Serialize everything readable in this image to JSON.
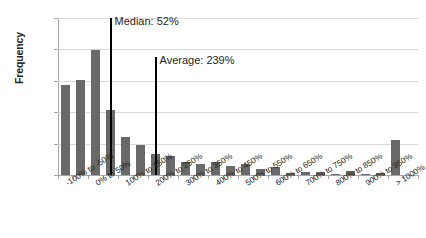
{
  "chart_data": {
    "type": "bar",
    "title": "",
    "subtitle": "",
    "xlabel": "",
    "ylabel": "Frequency",
    "ylim": [
      0,
      25
    ],
    "ytick_labels": [
      "0%",
      "5%",
      "10%",
      "15%",
      "20%",
      "25%"
    ],
    "ytick_values": [
      0,
      5,
      10,
      15,
      20,
      25
    ],
    "grid": true,
    "legend": "none",
    "bar_color": "#696969",
    "categories": [
      "-100% to -50%",
      "-50% to 0%",
      "0% to 50%",
      "50% to 100%",
      "100% to 150%",
      "150% to 200%",
      "200% to 250%",
      "250% to 300%",
      "300% to 350%",
      "350% to 400%",
      "400% to 450%",
      "450% to 500%",
      "500% to 550%",
      "550% to 600%",
      "600% to 650%",
      "650% to 700%",
      "700% to 750%",
      "750% to 800%",
      "800% to 850%",
      "850% to 900%",
      "900% to 950%",
      "950% to 1000%",
      "> 1000%",
      ""
    ],
    "visible_tick_labels": [
      "-100% to -50%",
      "0% to 50%",
      "100% to 150%",
      "200% to 250%",
      "300% to 350%",
      "400% to 450%",
      "500% to 550%",
      "600% to 650%",
      "700% to 750%",
      "800% to 850%",
      "900% to 950%",
      "> 1000%"
    ],
    "values": [
      14.3,
      15.2,
      19.9,
      10.4,
      6.0,
      4.7,
      3.3,
      3.0,
      2.1,
      1.8,
      2.0,
      1.4,
      1.7,
      0.9,
      1.2,
      0.3,
      0.5,
      0.5,
      0.1,
      0.6,
      0.1,
      0.25,
      5.5,
      0
    ],
    "annotations": [
      {
        "name": "median",
        "label": "Median: 52%",
        "value": 52,
        "bin_index": 3,
        "line_top_pct": 25.0
      },
      {
        "name": "average",
        "label": "Average: 239%",
        "value": 239,
        "bin_index": 6,
        "line_top_pct": 18.8
      }
    ]
  }
}
